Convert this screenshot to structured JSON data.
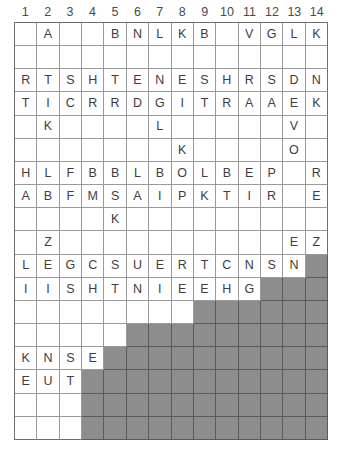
{
  "grid": {
    "title": "letter-grid-puzzle",
    "columns": 14,
    "rows": 18,
    "column_headers": [
      "1",
      "2",
      "3",
      "4",
      "5",
      "6",
      "7",
      "8",
      "9",
      "10",
      "11",
      "12",
      "13",
      "14"
    ],
    "colors": {
      "cell_background": "#ffffff",
      "shaded_background": "#8d8d8d",
      "grid_line": "#9a9a9a",
      "outer_border": "#6f6f6f",
      "letter_color": "#3d3d3d",
      "header_color": "#4a4a4a"
    },
    "letters": [
      [
        "",
        "A",
        "",
        "",
        "B",
        "N",
        "L",
        "K",
        "B",
        "",
        "V",
        "G",
        "L",
        "K"
      ],
      [
        "",
        "",
        "",
        "",
        "",
        "",
        "",
        "",
        "",
        "",
        "",
        "",
        "",
        ""
      ],
      [
        "R",
        "T",
        "S",
        "H",
        "T",
        "E",
        "N",
        "E",
        "S",
        "H",
        "R",
        "S",
        "D",
        "N"
      ],
      [
        "T",
        "I",
        "C",
        "R",
        "R",
        "D",
        "G",
        "I",
        "T",
        "R",
        "A",
        "A",
        "E",
        "K"
      ],
      [
        "",
        "K",
        "",
        "",
        "",
        "",
        "L",
        "",
        "",
        "",
        "",
        "",
        "V",
        ""
      ],
      [
        "",
        "",
        "",
        "",
        "",
        "",
        "",
        "K",
        "",
        "",
        "",
        "",
        "O",
        ""
      ],
      [
        "H",
        "L",
        "F",
        "B",
        "B",
        "L",
        "B",
        "O",
        "L",
        "B",
        "E",
        "P",
        "",
        "R"
      ],
      [
        "A",
        "B",
        "F",
        "M",
        "S",
        "A",
        "I",
        "P",
        "K",
        "T",
        "I",
        "R",
        "",
        "E"
      ],
      [
        "",
        "",
        "",
        "",
        "K",
        "",
        "",
        "",
        "",
        "",
        "",
        "",
        "",
        ""
      ],
      [
        "",
        "Z",
        "",
        "",
        "",
        "",
        "",
        "",
        "",
        "",
        "",
        "",
        "E",
        "Z"
      ],
      [
        "L",
        "E",
        "G",
        "C",
        "S",
        "U",
        "E",
        "R",
        "T",
        "C",
        "N",
        "S",
        "N",
        ""
      ],
      [
        "I",
        "I",
        "S",
        "H",
        "T",
        "N",
        "I",
        "E",
        "E",
        "H",
        "G",
        "",
        "",
        ""
      ],
      [
        "",
        "",
        "",
        "",
        "",
        "",
        "",
        "",
        "",
        "",
        "",
        "",
        "",
        ""
      ],
      [
        "",
        "",
        "",
        "",
        "",
        "",
        "",
        "",
        "",
        "",
        "",
        "",
        "",
        ""
      ],
      [
        "K",
        "N",
        "S",
        "E",
        "",
        "",
        "",
        "",
        "",
        "",
        "",
        "",
        "",
        ""
      ],
      [
        "E",
        "U",
        "T",
        "",
        "",
        "",
        "",
        "",
        "",
        "",
        "",
        "",
        "",
        ""
      ],
      [
        "",
        "",
        "",
        "",
        "",
        "",
        "",
        "",
        "",
        "",
        "",
        "",
        "",
        ""
      ],
      [
        "",
        "",
        "",
        "",
        "",
        "",
        "",
        "",
        "",
        "",
        "",
        "",
        "",
        ""
      ]
    ],
    "shaded": [
      [
        0,
        0,
        0,
        0,
        0,
        0,
        0,
        0,
        0,
        0,
        0,
        0,
        0,
        0
      ],
      [
        0,
        0,
        0,
        0,
        0,
        0,
        0,
        0,
        0,
        0,
        0,
        0,
        0,
        0
      ],
      [
        0,
        0,
        0,
        0,
        0,
        0,
        0,
        0,
        0,
        0,
        0,
        0,
        0,
        0
      ],
      [
        0,
        0,
        0,
        0,
        0,
        0,
        0,
        0,
        0,
        0,
        0,
        0,
        0,
        0
      ],
      [
        0,
        0,
        0,
        0,
        0,
        0,
        0,
        0,
        0,
        0,
        0,
        0,
        0,
        0
      ],
      [
        0,
        0,
        0,
        0,
        0,
        0,
        0,
        0,
        0,
        0,
        0,
        0,
        0,
        0
      ],
      [
        0,
        0,
        0,
        0,
        0,
        0,
        0,
        0,
        0,
        0,
        0,
        0,
        0,
        0
      ],
      [
        0,
        0,
        0,
        0,
        0,
        0,
        0,
        0,
        0,
        0,
        0,
        0,
        0,
        0
      ],
      [
        0,
        0,
        0,
        0,
        0,
        0,
        0,
        0,
        0,
        0,
        0,
        0,
        0,
        0
      ],
      [
        0,
        0,
        0,
        0,
        0,
        0,
        0,
        0,
        0,
        0,
        0,
        0,
        0,
        0
      ],
      [
        0,
        0,
        0,
        0,
        0,
        0,
        0,
        0,
        0,
        0,
        0,
        0,
        0,
        1
      ],
      [
        0,
        0,
        0,
        0,
        0,
        0,
        0,
        0,
        0,
        0,
        0,
        1,
        1,
        1
      ],
      [
        0,
        0,
        0,
        0,
        0,
        0,
        0,
        0,
        1,
        1,
        1,
        1,
        1,
        1
      ],
      [
        0,
        0,
        0,
        0,
        0,
        1,
        1,
        1,
        1,
        1,
        1,
        1,
        1,
        1
      ],
      [
        0,
        0,
        0,
        0,
        1,
        1,
        1,
        1,
        1,
        1,
        1,
        1,
        1,
        1
      ],
      [
        0,
        0,
        0,
        1,
        1,
        1,
        1,
        1,
        1,
        1,
        1,
        1,
        1,
        1
      ],
      [
        0,
        0,
        0,
        1,
        1,
        1,
        1,
        1,
        1,
        1,
        1,
        1,
        1,
        1
      ],
      [
        0,
        0,
        0,
        1,
        1,
        1,
        1,
        1,
        1,
        1,
        1,
        1,
        1,
        1
      ]
    ]
  }
}
